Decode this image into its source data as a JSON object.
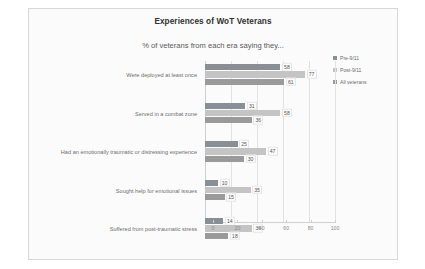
{
  "slide": {
    "title": "Experiences of WoT Veterans",
    "subtitle": "% of veterans from each era saying they..."
  },
  "chart_data": {
    "type": "bar",
    "orientation": "horizontal",
    "title": "Experiences of WoT Veterans",
    "subtitle": "% of veterans from each era saying they...",
    "xlabel": "",
    "ylabel": "",
    "xlim": [
      0,
      100
    ],
    "xticks": [
      0,
      20,
      40,
      60,
      80,
      100
    ],
    "grid": true,
    "legend_position": "right",
    "categories": [
      "Were deployed at least once",
      "Served in a combat zone",
      "Had an emotionally traumatic or distressing experience",
      "Sought help for emotional issues",
      "Suffered from post-traumatic stress"
    ],
    "series": [
      {
        "name": "Pre-9/11",
        "color": "#8a8f96",
        "values": [
          58,
          31,
          25,
          10,
          14
        ]
      },
      {
        "name": "Post-9/11",
        "color": "#c4c4c4",
        "values": [
          77,
          58,
          47,
          35,
          36
        ]
      },
      {
        "name": "All veterans",
        "color": "#9a9a9a",
        "values": [
          61,
          36,
          30,
          15,
          18
        ]
      }
    ]
  }
}
